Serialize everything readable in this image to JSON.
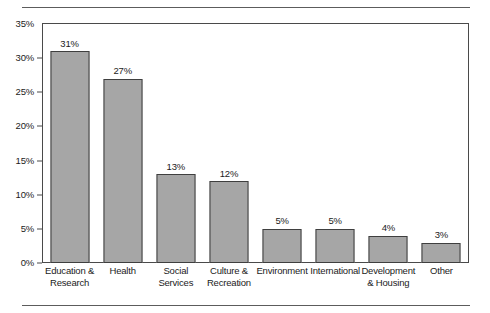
{
  "chart_data": {
    "type": "bar",
    "title": "",
    "subtitle": "",
    "xlabel": "",
    "ylabel": "",
    "ylim": [
      0,
      35
    ],
    "grid": false,
    "legend": null,
    "orientation": "vertical",
    "bar_color": "#a6a6a6",
    "bar_edge_color": "#3f3f3f",
    "frame_color": "#4a4a4a",
    "value_suffix": "%",
    "categories": [
      "Education & Research",
      "Health",
      "Social Services",
      "Culture & Recreation",
      "Environment",
      "International",
      "Development & Housing",
      "Other"
    ],
    "category_lines": [
      [
        "Education &",
        "Research"
      ],
      [
        "Health"
      ],
      [
        "Social",
        "Services"
      ],
      [
        "Culture &",
        "Recreation"
      ],
      [
        "Environment"
      ],
      [
        "International"
      ],
      [
        "Development",
        "& Housing"
      ],
      [
        "Other"
      ]
    ],
    "values": [
      31,
      27,
      13,
      12,
      5,
      5,
      4,
      3
    ],
    "data_labels": [
      "31%",
      "27%",
      "13%",
      "12%",
      "5%",
      "5%",
      "4%",
      "3%"
    ],
    "yticks": [
      0,
      5,
      10,
      15,
      20,
      25,
      30,
      35
    ],
    "ytick_labels": [
      "0%",
      "5%",
      "10%",
      "15%",
      "20%",
      "25%",
      "30%",
      "35%"
    ]
  }
}
